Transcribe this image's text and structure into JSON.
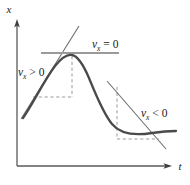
{
  "figure": {
    "axes": {
      "vertical_label": "x",
      "horizontal_label": "t",
      "origin_x": 17,
      "origin_y": 166,
      "vertical_top_y": 20,
      "horizontal_right_x": 172
    },
    "annotations": [
      {
        "id": "vx-positive",
        "variable": "v",
        "subscript": "x",
        "operator": ">",
        "value": "0",
        "text": "v_x > 0",
        "x": 18,
        "y": 76,
        "region": "rising-segment"
      },
      {
        "id": "vx-zero",
        "variable": "v",
        "subscript": "x",
        "operator": "=",
        "value": "0",
        "text": "v_x = 0",
        "x": 92,
        "y": 48,
        "region": "peak"
      },
      {
        "id": "vx-negative",
        "variable": "v",
        "subscript": "x",
        "operator": "<",
        "value": "0",
        "text": "v_x < 0",
        "x": 141,
        "y": 117,
        "region": "falling-segment"
      }
    ],
    "colors": {
      "axis": "#5a5a5a",
      "curve": "#4a4a4a",
      "tangent": "#6e6e6e",
      "tangent_horizontal": "#9a9a9a",
      "dashed": "#8f8f8f",
      "text": "#1a1a1a",
      "background": "#ffffff"
    },
    "curve": {
      "description": "smooth S-shaped position curve rising to a maximum then falling and flattening",
      "path": "M 23,118 C 33,104 43,82 55,66 C 63,56 68,54 72,55 C 78,56 83,64 89,78 C 96,95 103,113 112,124 C 122,136 140,135 152,133 C 162,131.5 170,131 176,131"
    },
    "tangents": [
      {
        "id": "tangent-rising",
        "slope_sign": "positive",
        "x1": 21,
        "y1": 119,
        "x2": 79,
        "y2": 26
      },
      {
        "id": "tangent-peak",
        "slope_sign": "zero",
        "x1": 41,
        "y1": 53,
        "x2": 119,
        "y2": 53
      },
      {
        "id": "tangent-falling",
        "slope_sign": "negative",
        "x1": 107,
        "y1": 81,
        "x2": 166,
        "y2": 149
      }
    ],
    "dashed_guides": [
      {
        "id": "rise-run-left-horizontal",
        "x1": 33,
        "y1": 97,
        "x2": 72,
        "y2": 97
      },
      {
        "id": "rise-run-left-vertical",
        "x1": 72,
        "y1": 56,
        "x2": 72,
        "y2": 97
      },
      {
        "id": "rise-run-right-vertical",
        "x1": 117,
        "y1": 87,
        "x2": 117,
        "y2": 139
      },
      {
        "id": "rise-run-right-horizontal",
        "x1": 117,
        "y1": 139,
        "x2": 159,
        "y2": 139
      }
    ]
  }
}
